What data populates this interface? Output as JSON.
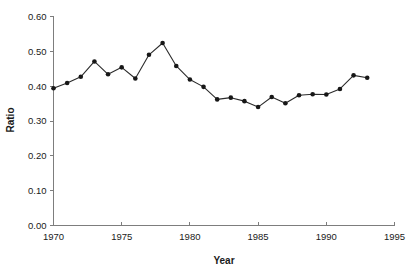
{
  "chart_data": {
    "type": "line",
    "title": "",
    "xlabel": "Year",
    "ylabel": "Ratio",
    "xlim": [
      1970,
      1995
    ],
    "ylim": [
      0.0,
      0.6
    ],
    "grid": false,
    "legend": "none",
    "marker": "filled-circle",
    "line_color": "#2b2b2b",
    "marker_color": "#171717",
    "axis_color": "#7d7d7d",
    "xticks": [
      1970,
      1975,
      1980,
      1985,
      1990,
      1995
    ],
    "xtick_labels": [
      "1970",
      "1975",
      "1980",
      "1985",
      "1990",
      "1995"
    ],
    "yticks": [
      0.0,
      0.1,
      0.2,
      0.3,
      0.4,
      0.5,
      0.6
    ],
    "ytick_labels": [
      "0.00",
      "0.10",
      "0.20",
      "0.30",
      "0.40",
      "0.50",
      "0.60"
    ],
    "x": [
      1970,
      1971,
      1972,
      1973,
      1974,
      1975,
      1976,
      1977,
      1978,
      1979,
      1980,
      1981,
      1982,
      1983,
      1984,
      1985,
      1986,
      1987,
      1988,
      1989,
      1990,
      1991,
      1992,
      1993
    ],
    "values": [
      0.394,
      0.409,
      0.427,
      0.471,
      0.434,
      0.454,
      0.422,
      0.49,
      0.524,
      0.458,
      0.419,
      0.398,
      0.362,
      0.367,
      0.357,
      0.34,
      0.369,
      0.351,
      0.374,
      0.377,
      0.376,
      0.392,
      0.431,
      0.424
    ],
    "series": [
      {
        "name": "Ratio",
        "values": [
          0.394,
          0.409,
          0.427,
          0.471,
          0.434,
          0.454,
          0.422,
          0.49,
          0.524,
          0.458,
          0.419,
          0.398,
          0.362,
          0.367,
          0.357,
          0.34,
          0.369,
          0.351,
          0.374,
          0.377,
          0.376,
          0.392,
          0.431,
          0.424
        ]
      }
    ]
  }
}
